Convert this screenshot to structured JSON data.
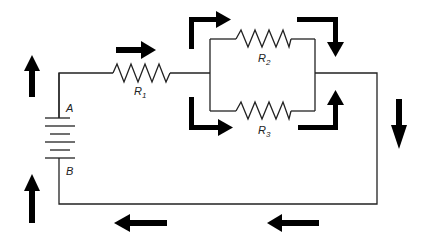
{
  "diagram": {
    "type": "series-parallel resistor circuit with battery",
    "battery": {
      "terminal_top_label": "A",
      "terminal_bottom_label": "B"
    },
    "resistors": [
      {
        "id": "R1",
        "label": "R",
        "subscript": "1",
        "position": "series, top-left wire"
      },
      {
        "id": "R2",
        "label": "R",
        "subscript": "2",
        "position": "parallel branch, upper"
      },
      {
        "id": "R3",
        "label": "R",
        "subscript": "3",
        "position": "parallel branch, lower"
      }
    ],
    "current_arrows": [
      {
        "location": "left of battery top",
        "direction": "up"
      },
      {
        "location": "left of battery bottom",
        "direction": "up"
      },
      {
        "location": "above R1",
        "direction": "right"
      },
      {
        "location": "entering R2 branch",
        "direction": "up-then-right"
      },
      {
        "location": "leaving R2 branch",
        "direction": "right-then-down"
      },
      {
        "location": "entering R3 branch",
        "direction": "down-then-right"
      },
      {
        "location": "leaving R3 branch",
        "direction": "right-then-up"
      },
      {
        "location": "right vertical wire",
        "direction": "down"
      },
      {
        "location": "bottom wire right",
        "direction": "left"
      },
      {
        "location": "bottom wire left",
        "direction": "left"
      }
    ]
  }
}
